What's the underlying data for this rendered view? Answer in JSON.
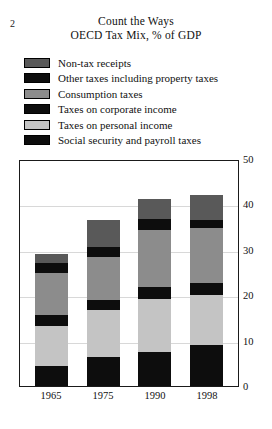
{
  "page": {
    "number": "2"
  },
  "header": {
    "title": "Count the Ways",
    "subtitle": "OECD Tax Mix, % of GDP"
  },
  "legend": {
    "items": [
      {
        "label": "Non-tax receipts",
        "color": "#595959",
        "key": "non_tax_receipts"
      },
      {
        "label": "Other taxes including property taxes",
        "color": "#0d0d0d",
        "key": "other_taxes"
      },
      {
        "label": "Consumption taxes",
        "color": "#8c8c8c",
        "key": "consumption_taxes"
      },
      {
        "label": "Taxes on corporate income",
        "color": "#0d0d0d",
        "key": "corporate_income"
      },
      {
        "label": "Taxes on personal income",
        "color": "#c4c4c4",
        "key": "personal_income"
      },
      {
        "label": "Social security and payroll taxes",
        "color": "#0d0d0d",
        "key": "social_security"
      }
    ]
  },
  "chart_data": {
    "type": "bar",
    "subtype": "stacked-vertical",
    "title": "Count the Ways",
    "subtitle": "OECD Tax Mix, % of GDP",
    "xlabel": "",
    "ylabel": "% of GDP",
    "categories": [
      "1965",
      "1975",
      "1990",
      "1998"
    ],
    "ylim": [
      0,
      50
    ],
    "yticks": [
      0,
      10,
      20,
      30,
      40,
      50
    ],
    "ytick_labels": [
      "0",
      "10",
      "20",
      "30",
      "40",
      "50"
    ],
    "y_axis_position": "right",
    "grid": true,
    "legend_position": "above-plot",
    "stack_order_bottom_to_top": [
      "social_security",
      "personal_income",
      "corporate_income",
      "consumption_taxes",
      "other_taxes",
      "non_tax_receipts"
    ],
    "series": [
      {
        "name": "Social security and payroll taxes",
        "color": "#0d0d0d",
        "values": [
          4.3,
          6.5,
          7.6,
          9.0
        ]
      },
      {
        "name": "Taxes on personal income",
        "color": "#c4c4c4",
        "values": [
          9.0,
          10.3,
          11.5,
          11.0
        ]
      },
      {
        "name": "Taxes on corporate income",
        "color": "#0d0d0d",
        "values": [
          2.3,
          2.2,
          2.8,
          2.6
        ]
      },
      {
        "name": "Consumption taxes",
        "color": "#8c8c8c",
        "values": [
          9.4,
          9.4,
          12.5,
          12.3
        ]
      },
      {
        "name": "Other taxes including property taxes",
        "color": "#0d0d0d",
        "values": [
          2.0,
          2.2,
          2.3,
          1.6
        ]
      },
      {
        "name": "Non-tax receipts",
        "color": "#595959",
        "values": [
          2.0,
          6.0,
          4.5,
          5.5
        ]
      }
    ],
    "totals": [
      29.0,
      36.6,
      41.2,
      42.0
    ]
  }
}
